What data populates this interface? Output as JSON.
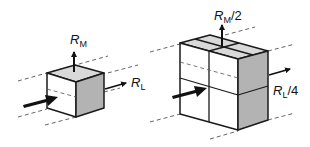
{
  "figure": {
    "left_cube": {
      "moment_label": "R",
      "moment_sub": "M",
      "moment_suffix": "",
      "load_label": "R",
      "load_sub": "L",
      "load_suffix": ""
    },
    "right_block": {
      "moment_label": "R",
      "moment_sub": "M",
      "moment_suffix": "/2",
      "load_label": "R",
      "load_sub": "L",
      "load_suffix": "/4"
    }
  },
  "colors": {
    "stroke": "#1a1a1a",
    "top_face": "#d9d9d9",
    "side_face": "#b3b3b3",
    "front_face": "#ffffff",
    "dashed": "#555555"
  }
}
